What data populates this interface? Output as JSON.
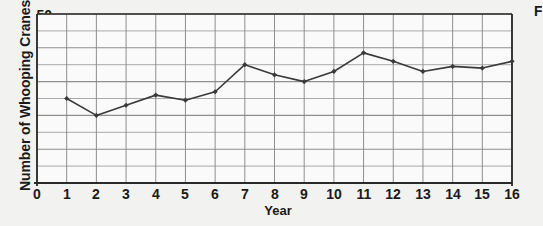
{
  "chart_data": {
    "type": "line",
    "title": "",
    "xlabel": "Year",
    "ylabel": "Number of Whooping Cranes",
    "xlim": [
      0,
      16
    ],
    "ylim": [
      0,
      50
    ],
    "x_ticks": [
      "0",
      "1",
      "2",
      "3",
      "4",
      "5",
      "6",
      "7",
      "8",
      "9",
      "10",
      "11",
      "12",
      "13",
      "14",
      "15",
      "16"
    ],
    "y_ticks": [
      "10",
      "20",
      "30",
      "40",
      "50"
    ],
    "y_minor_step": 5,
    "grid": true,
    "legend": "none",
    "marker": "diamond",
    "line_color": "#3a3a3a",
    "grid_color": "#8a8a8a",
    "background_color": "#f2f2f0",
    "plot_background_color": "#fafafa",
    "x": [
      1,
      2,
      3,
      4,
      5,
      6,
      7,
      8,
      9,
      10,
      11,
      12,
      13,
      14,
      15,
      16
    ],
    "values": [
      25,
      20,
      23,
      26,
      24.5,
      27,
      35,
      32,
      30,
      33,
      38.5,
      36,
      33,
      34.5,
      34,
      36
    ]
  },
  "corner": {
    "clipped_letter": "F"
  }
}
